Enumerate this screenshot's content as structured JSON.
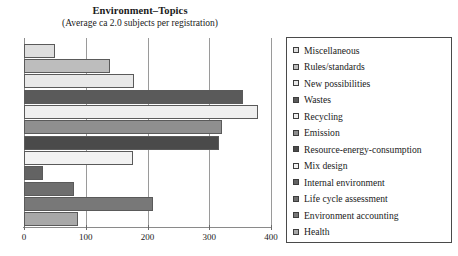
{
  "chart_data": {
    "type": "bar",
    "orientation": "horizontal",
    "title": "Environment–Topics",
    "subtitle": "(Average ca 2.0 subjects per registration)",
    "xlabel": "",
    "ylabel": "",
    "xlim": [
      0,
      400
    ],
    "xticks": [
      0,
      100,
      200,
      300,
      400
    ],
    "xtick_labels": [
      "0",
      "100",
      "200",
      "300",
      "400"
    ],
    "grid": true,
    "grid_axis": "x",
    "legend_position": "right",
    "categories": [
      "Miscellaneous",
      "Rules/standards",
      "New possibilities",
      "Wastes",
      "Recycling",
      "Emission",
      "Resource-energy-consumption",
      "Mix design",
      "Internal environment",
      "Life cycle assessment",
      "Environment accounting",
      "Health"
    ],
    "values": [
      50,
      140,
      178,
      355,
      379,
      321,
      316,
      176,
      31,
      81,
      209,
      87
    ],
    "colors": [
      "#dedede",
      "#bdbdbd",
      "#e8e8e8",
      "#5a5a5a",
      "#efefef",
      "#8f8f8f",
      "#4a4a4a",
      "#f2f2f2",
      "#636363",
      "#6e6e6e",
      "#787878",
      "#a8a8a8"
    ],
    "legend_entries": [
      {
        "label": "Miscellaneous",
        "color": "#dedede"
      },
      {
        "label": "Rules/standards",
        "color": "#bdbdbd"
      },
      {
        "label": "New possibilities",
        "color": "#e8e8e8"
      },
      {
        "label": "Wastes",
        "color": "#5a5a5a"
      },
      {
        "label": "Recycling",
        "color": "#efefef"
      },
      {
        "label": "Emission",
        "color": "#8f8f8f"
      },
      {
        "label": "Resource-energy-consumption",
        "color": "#4a4a4a"
      },
      {
        "label": "Mix design",
        "color": "#f2f2f2"
      },
      {
        "label": "Internal environment",
        "color": "#636363"
      },
      {
        "label": "Life cycle assessment",
        "color": "#6e6e6e"
      },
      {
        "label": "Environment accounting",
        "color": "#787878"
      },
      {
        "label": "Health",
        "color": "#a8a8a8"
      }
    ]
  }
}
